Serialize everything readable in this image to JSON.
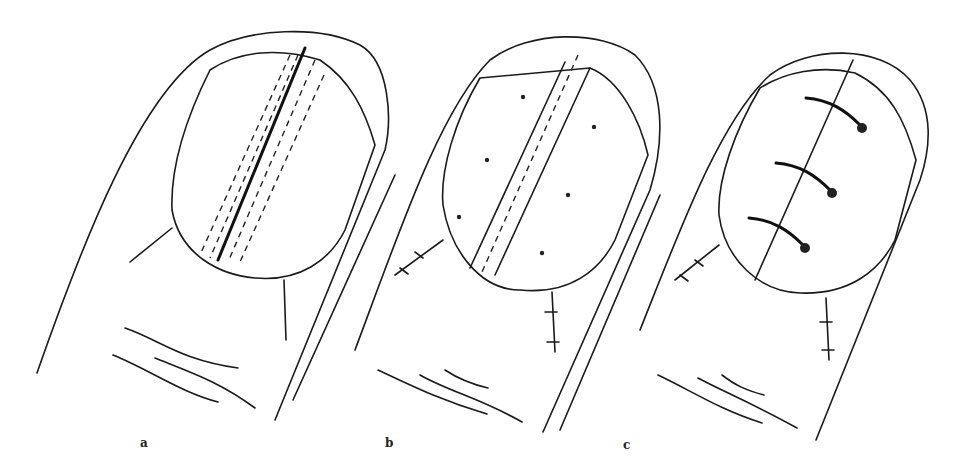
{
  "figure": {
    "panels": [
      {
        "id": "a",
        "label": "a",
        "description": "Nail with longitudinal split and dashed excision margins"
      },
      {
        "id": "b",
        "label": "b",
        "description": "Nail strip excised, lateral skin incisions sutured"
      },
      {
        "id": "c",
        "label": "c",
        "description": "Nail halves reapproximated with three sutures"
      }
    ]
  }
}
